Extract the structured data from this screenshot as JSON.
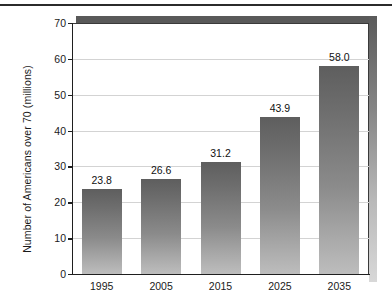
{
  "chart_data": {
    "type": "bar",
    "title": "",
    "subtitle": "",
    "xlabel": "",
    "ylabel": "Number of Americans over 70 (millions)",
    "categories": [
      "1995",
      "2005",
      "2015",
      "2025",
      "2035"
    ],
    "values": [
      23.8,
      26.6,
      31.2,
      43.9,
      58.0
    ],
    "value_labels": [
      "23.8",
      "26.6",
      "31.2",
      "43.9",
      "58.0"
    ],
    "series": [
      {
        "name": "Number of Americans over 70 (millions)",
        "values": [
          23.8,
          26.6,
          31.2,
          43.9,
          58.0
        ]
      }
    ],
    "ylim": [
      0,
      70
    ],
    "ytick_values": [
      0,
      10,
      20,
      30,
      40,
      50,
      60,
      70
    ],
    "ytick_labels": [
      "0",
      "10",
      "20",
      "30",
      "40",
      "50",
      "60",
      "70"
    ],
    "grid": true,
    "grid_axis": "y",
    "legend": false,
    "legend_position": "none",
    "bar_color": "#7d7d7d",
    "grid_color": "#d3d3d3",
    "axis_color": "#1f1f1f",
    "text_color": "#1a1a1a",
    "background": "#ffffff",
    "data_labels_shown": true,
    "annotations": []
  }
}
